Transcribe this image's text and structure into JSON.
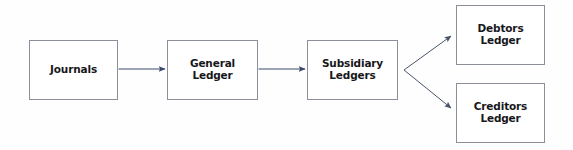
{
  "diagram": {
    "background_color": "#fefefe",
    "box_border_color": "#8a8f9a",
    "box_fill_color": "#ffffff",
    "text_color": "#17171b",
    "arrow_color": "#3b4a6b",
    "branch_arrow_color": "#4a5568",
    "nodes": [
      {
        "id": "journals",
        "label": "Journals",
        "x": 29,
        "y": 40,
        "width": 89,
        "height": 60
      },
      {
        "id": "general-ledger",
        "label": "General\nLedger",
        "x": 167,
        "y": 40,
        "width": 91,
        "height": 60
      },
      {
        "id": "subsidiary-ledgers",
        "label": "Subsidiary\nLedgers",
        "x": 307,
        "y": 40,
        "width": 91,
        "height": 60
      },
      {
        "id": "debtors-ledger",
        "label": "Debtors\nLedger",
        "x": 456,
        "y": 5,
        "width": 89,
        "height": 60
      },
      {
        "id": "creditors-ledger",
        "label": "Creditors\nLedger",
        "x": 456,
        "y": 83,
        "width": 89,
        "height": 60
      }
    ],
    "connectors": [
      {
        "id": "journals-to-general-ledger",
        "from": "journals",
        "to": "general-ledger",
        "style": "straight-arrow"
      },
      {
        "id": "general-ledger-to-subsidiary-ledgers",
        "from": "general-ledger",
        "to": "subsidiary-ledgers",
        "style": "straight-arrow"
      },
      {
        "id": "subsidiary-ledgers-to-debtors-ledger",
        "from": "subsidiary-ledgers",
        "to": "debtors-ledger",
        "style": "branch-arrow-up"
      },
      {
        "id": "subsidiary-ledgers-to-creditors-ledger",
        "from": "subsidiary-ledgers",
        "to": "creditors-ledger",
        "style": "branch-arrow-down"
      }
    ]
  }
}
